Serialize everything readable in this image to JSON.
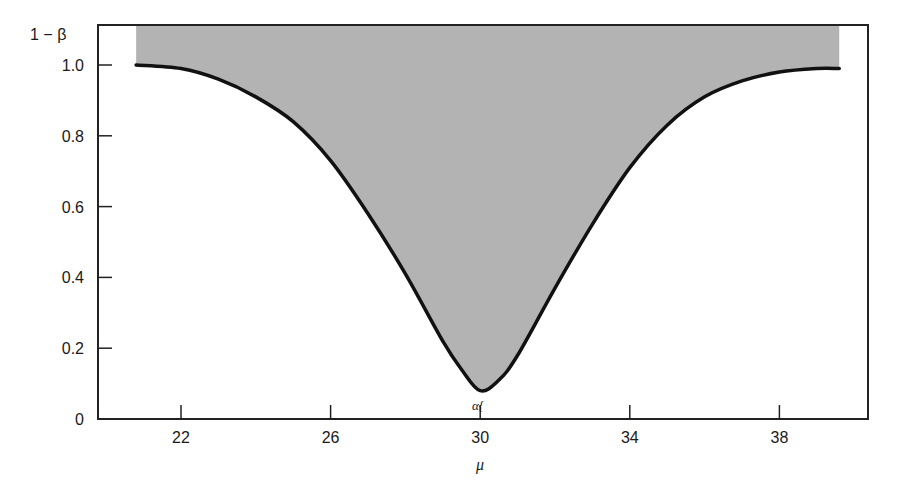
{
  "chart_data": {
    "type": "area",
    "title": "",
    "xlabel": "μ",
    "ylabel": "1 − β",
    "xlim": [
      19.5,
      40.5
    ],
    "ylim": [
      0,
      1.11
    ],
    "x_ticks": [
      22,
      26,
      30,
      34,
      38
    ],
    "x_tick_labels": [
      "22",
      "26",
      "30",
      "34",
      "38"
    ],
    "y_ticks": [
      0,
      0.2,
      0.4,
      0.6,
      0.8,
      1.0
    ],
    "y_tick_labels": [
      "0",
      "0.2",
      "0.4",
      "0.6",
      "0.8",
      "1.0"
    ],
    "grid": false,
    "legend": null,
    "annotations": [
      {
        "text": "α{",
        "x": 30,
        "y": 0.02
      }
    ],
    "series": [
      {
        "name": "Power curve 1 − β",
        "x": [
          20.8,
          22,
          23,
          24,
          25,
          26,
          27,
          28,
          29,
          29.5,
          30,
          30.5,
          31,
          32,
          33,
          34,
          35,
          36,
          37,
          38,
          39,
          39.6
        ],
        "values": [
          1.0,
          0.99,
          0.96,
          0.91,
          0.84,
          0.73,
          0.58,
          0.41,
          0.22,
          0.14,
          0.08,
          0.11,
          0.18,
          0.37,
          0.55,
          0.71,
          0.83,
          0.91,
          0.955,
          0.98,
          0.99,
          0.99
        ]
      }
    ],
    "shaded_region": {
      "description": "Region above power curve up to plot top",
      "color": "#b3b3b3"
    }
  },
  "axes": {
    "y_title": "1 − β",
    "x_title": "μ",
    "alpha_label": "α{"
  },
  "colors": {
    "fill": "#b3b3b3",
    "curve": "#111111",
    "axis": "#222222"
  }
}
